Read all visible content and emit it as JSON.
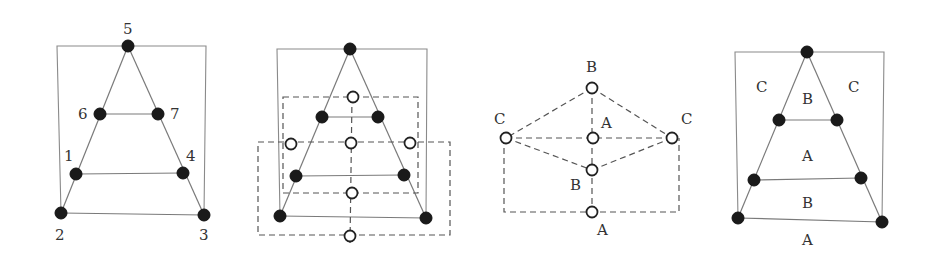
{
  "figure": {
    "panels": [
      {
        "id": "panel-1-triangle-graph",
        "node_labels": {
          "n5": "5",
          "n6": "6",
          "n7": "7",
          "n1": "1",
          "n4": "4",
          "n2": "2",
          "n3": "3"
        }
      },
      {
        "id": "panel-2-dual-construction",
        "description": "Triangle graph with hollow dual vertices and dashed dual edges"
      },
      {
        "id": "panel-3-dual-graph",
        "node_labels": {
          "top": "B",
          "left": "C",
          "center": "A",
          "right": "C",
          "lower": "B",
          "bottom": "A"
        }
      },
      {
        "id": "panel-4-face-coloring",
        "face_labels": {
          "outer_left": "C",
          "outer_right": "C",
          "top_face": "B",
          "middle_face": "A",
          "lower_face": "B",
          "outer_bottom": "A"
        }
      }
    ],
    "colors": {
      "filled_node": "#1a1a1a",
      "hollow_node_stroke": "#222222",
      "edge": "#7a7a7a",
      "dashed_edge": "#555555"
    }
  }
}
